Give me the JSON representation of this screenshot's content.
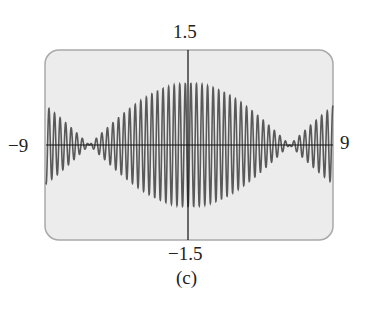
{
  "figure": {
    "caption": "(c)",
    "frame_color": "#ececec",
    "frame_border": "#a9a9a9",
    "curve_color": "#595959",
    "axis_color": "#111111"
  },
  "chart_data": {
    "type": "line",
    "title": "",
    "xlabel": "",
    "ylabel": "",
    "xlim": [
      -9,
      9
    ],
    "ylim": [
      -1.5,
      1.5
    ],
    "tick_labels": {
      "xmin": "−9",
      "xmax": "9",
      "ymax": "1.5",
      "ymin": "−1.5"
    },
    "grid": false,
    "legend": null,
    "model": {
      "envelope": "cos(x/4)",
      "carrier": "sin(18x)",
      "carrier_freq": 18,
      "envelope_freq": 0.25
    },
    "envelope_samples": {
      "x": [
        -9,
        -8,
        -7,
        -6.28,
        -5,
        -4,
        -3,
        -2,
        -1,
        0,
        1,
        2,
        3,
        4,
        5,
        6.28,
        7,
        8,
        9
      ],
      "amplitude": [
        0.63,
        0.42,
        0.17,
        0.0,
        0.32,
        0.54,
        0.73,
        0.88,
        0.97,
        1.0,
        0.97,
        0.88,
        0.73,
        0.54,
        0.32,
        0.0,
        0.17,
        0.42,
        0.63
      ]
    }
  }
}
